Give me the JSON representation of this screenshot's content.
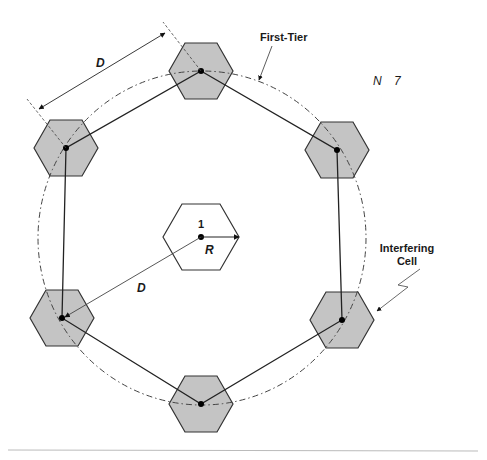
{
  "diagram": {
    "labels": {
      "first_tier": "First-Tier",
      "n_label": "N",
      "n_value": "7",
      "interfering_line1": "Interfering",
      "interfering_line2": "Cell",
      "d_top": "D",
      "d_center": "D",
      "r_label": "R",
      "center_cell": "1"
    },
    "colors": {
      "cochannel_fill": "#c4c4c4",
      "stroke": "#333333",
      "center_fill": "#ffffff",
      "rule": "#bbbbbb"
    },
    "cells": [
      {
        "id": "center",
        "cx": 201,
        "cy": 237,
        "r": 38,
        "shaded": false
      },
      {
        "id": "top",
        "cx": 201,
        "cy": 71,
        "r": 32,
        "shaded": true
      },
      {
        "id": "upper-left",
        "cx": 66,
        "cy": 148,
        "r": 32,
        "shaded": true
      },
      {
        "id": "upper-right",
        "cx": 337,
        "cy": 150,
        "r": 32,
        "shaded": true
      },
      {
        "id": "lower-left",
        "cx": 62,
        "cy": 318,
        "r": 32,
        "shaded": true
      },
      {
        "id": "lower-right",
        "cx": 342,
        "cy": 320,
        "r": 32,
        "shaded": true
      },
      {
        "id": "bottom",
        "cx": 201,
        "cy": 404,
        "r": 32,
        "shaded": true
      }
    ]
  }
}
